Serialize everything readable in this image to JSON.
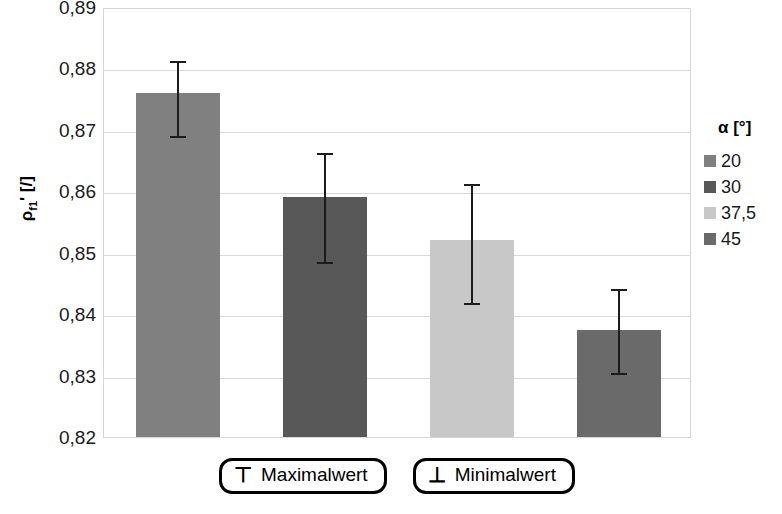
{
  "chart_data": {
    "type": "bar",
    "title": "",
    "xlabel": "",
    "ylabel": "ρf1' [/]",
    "ylabel_base": "ρ",
    "ylabel_sub": "f1",
    "ylabel_suffix": "' [/]",
    "ylim": [
      0.82,
      0.89
    ],
    "ytick_labels": [
      "0,89",
      "0,88",
      "0,87",
      "0,86",
      "0,85",
      "0,84",
      "0,83",
      "0,82"
    ],
    "ytick_values": [
      0.89,
      0.88,
      0.87,
      0.86,
      0.85,
      0.84,
      0.83,
      0.82
    ],
    "grid": true,
    "legend_position": "right",
    "categories": [
      "20",
      "30",
      "37,5",
      "45"
    ],
    "values": [
      0.876,
      0.859,
      0.852,
      0.8375
    ],
    "err_max": [
      0.8815,
      0.8665,
      0.8615,
      0.8445
    ],
    "err_min": [
      0.869,
      0.8485,
      0.8418,
      0.8305
    ],
    "series": [
      {
        "name": "α [°]",
        "values": [
          0.876,
          0.859,
          0.852,
          0.8375
        ],
        "colors": [
          "#808080",
          "#585858",
          "#c8c8c8",
          "#6a6a6a"
        ]
      }
    ],
    "bars": [
      {
        "category": "20",
        "value": 0.876,
        "max": 0.8815,
        "min": 0.869,
        "color": "#808080"
      },
      {
        "category": "30",
        "value": 0.859,
        "max": 0.8665,
        "min": 0.8485,
        "color": "#585858"
      },
      {
        "category": "37,5",
        "value": 0.852,
        "max": 0.8615,
        "min": 0.8418,
        "color": "#c8c8c8"
      },
      {
        "category": "45",
        "value": 0.8375,
        "max": 0.8445,
        "min": 0.8305,
        "color": "#6a6a6a"
      }
    ]
  },
  "legend": {
    "title": "α [°]",
    "items": [
      {
        "label": "20",
        "color": "#808080"
      },
      {
        "label": "30",
        "color": "#585858"
      },
      {
        "label": "37,5",
        "color": "#c8c8c8"
      },
      {
        "label": "45",
        "color": "#6a6a6a"
      }
    ]
  },
  "bottom_key": {
    "items": [
      {
        "glyph": "⊤",
        "label": "Maximalwert"
      },
      {
        "glyph": "⊥",
        "label": "Minimalwert"
      }
    ]
  },
  "colors": {
    "gridline": "#d9d9d9",
    "axis": "#d6d6d6",
    "errorbar": "#1c1c1c",
    "text": "#000000"
  }
}
